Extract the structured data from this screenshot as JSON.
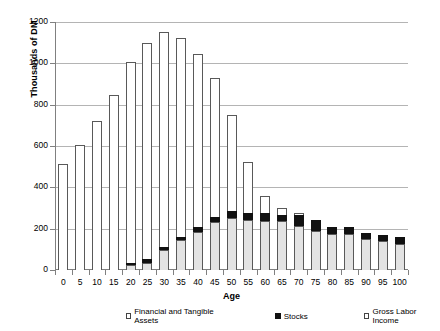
{
  "chart_data": {
    "type": "bar",
    "stacked": true,
    "title": "",
    "xlabel": "Age",
    "ylabel": "Thousands of DM",
    "ylim": [
      0,
      1200
    ],
    "ytick_step": 200,
    "yticks": [
      0,
      200,
      400,
      600,
      800,
      1000,
      1200
    ],
    "grid": true,
    "legend_position": "bottom",
    "categories": [
      "0",
      "5",
      "10",
      "15",
      "20",
      "25",
      "30",
      "35",
      "40",
      "45",
      "50",
      "55",
      "60",
      "65",
      "70",
      "75",
      "80",
      "85",
      "90",
      "95",
      "100"
    ],
    "series": [
      {
        "name": "Financial and Tangible Assets",
        "color": "#e3e3e3",
        "values": [
          0,
          0,
          0,
          0,
          22,
          35,
          96,
          143,
          183,
          233,
          252,
          240,
          238,
          235,
          212,
          190,
          172,
          172,
          152,
          140,
          127
        ]
      },
      {
        "name": "Stocks",
        "color": "#111111",
        "values": [
          0,
          0,
          0,
          0,
          11,
          16,
          16,
          19,
          25,
          26,
          32,
          36,
          38,
          31,
          52,
          54,
          38,
          34,
          28,
          31,
          34
        ]
      },
      {
        "name": "Gross Labor Income",
        "color": "#ffffff",
        "values": [
          511,
          607,
          719,
          847,
          975,
          1049,
          1039,
          963,
          836,
          668,
          464,
          246,
          82,
          33,
          10,
          0,
          0,
          0,
          0,
          0,
          0
        ]
      }
    ],
    "totals": [
      511,
      607,
      719,
      847,
      1008,
      1100,
      1151,
      1125,
      1044,
      927,
      748,
      522,
      358,
      299,
      274,
      244,
      210,
      206,
      180,
      171,
      161
    ]
  },
  "legend": {
    "items": [
      {
        "label": "Financial and Tangible Assets",
        "marker": "open-square"
      },
      {
        "label": "Stocks",
        "marker": "filled-square"
      },
      {
        "label": "Gross Labor Income",
        "marker": "open-square"
      }
    ]
  }
}
